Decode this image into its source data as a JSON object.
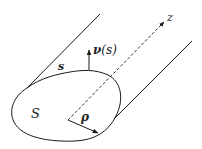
{
  "figure": {
    "type": "waveguide-cross-section",
    "labels": {
      "normal": "ν(s)",
      "normal_sym": "ν",
      "normal_arg": "(s)",
      "arc": "s",
      "axis": "z",
      "region": "S",
      "radius": "ρ"
    },
    "colors": {
      "stroke": "#1a1a1a",
      "background": "#ffffff"
    }
  }
}
